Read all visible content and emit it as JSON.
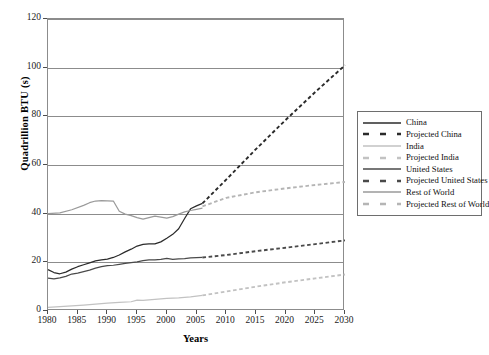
{
  "axes": {
    "ylabel": "Quadrillion BTU (s)",
    "xlabel": "Years",
    "yticks": [
      "0",
      "20",
      "40",
      "60",
      "80",
      "100",
      "120"
    ],
    "xticks": [
      "1980",
      "1985",
      "1990",
      "1995",
      "2000",
      "2005",
      "2010",
      "2015",
      "2020",
      "2025",
      "2030"
    ]
  },
  "legend": {
    "items": [
      {
        "label": "China",
        "style": "solid",
        "color": "#2b2b2b"
      },
      {
        "label": "Projected China",
        "style": "dashed",
        "color": "#2b2b2b"
      },
      {
        "label": "India",
        "style": "solid",
        "color": "#c2c2c2"
      },
      {
        "label": "Projected India",
        "style": "dashed",
        "color": "#c2c2c2"
      },
      {
        "label": "United States",
        "style": "solid",
        "color": "#4a4a4a"
      },
      {
        "label": "Projected United States",
        "style": "dashed",
        "color": "#4a4a4a"
      },
      {
        "label": "Rest of World",
        "style": "solid",
        "color": "#9a9a9a"
      },
      {
        "label": "Projected Rest of World",
        "style": "dashed",
        "color": "#b5b5b5"
      }
    ]
  },
  "chart_data": {
    "type": "line",
    "title": "",
    "xlabel": "Years",
    "ylabel": "Quadrillion BTU (s)",
    "xlim": [
      1980,
      2030
    ],
    "ylim": [
      0,
      120
    ],
    "grid": true,
    "legend_position": "right",
    "series": [
      {
        "name": "China",
        "color": "#2b2b2b",
        "style": "solid",
        "x": [
          1980,
          1981,
          1982,
          1983,
          1984,
          1985,
          1986,
          1987,
          1988,
          1989,
          1990,
          1991,
          1992,
          1993,
          1994,
          1995,
          1996,
          1997,
          1998,
          1999,
          2000,
          2001,
          2002,
          2003,
          2004,
          2005,
          2006
        ],
        "y": [
          17.0,
          15.8,
          15.3,
          16.0,
          17.2,
          18.2,
          19.0,
          19.8,
          20.6,
          21.0,
          21.3,
          22.0,
          23.0,
          24.3,
          25.4,
          26.7,
          27.4,
          27.6,
          27.6,
          28.4,
          29.9,
          31.5,
          33.8,
          38.0,
          42.0,
          43.2,
          44.2
        ]
      },
      {
        "name": "Projected China",
        "color": "#2b2b2b",
        "style": "dashed",
        "x": [
          2006,
          2010,
          2015,
          2020,
          2025,
          2030
        ],
        "y": [
          44.2,
          54.0,
          66.5,
          78.5,
          90.0,
          101.0
        ]
      },
      {
        "name": "India",
        "color": "#c2c2c2",
        "style": "solid",
        "x": [
          1980,
          1982,
          1984,
          1986,
          1988,
          1990,
          1992,
          1994,
          1995,
          1996,
          1998,
          2000,
          2002,
          2004,
          2005,
          2006
        ],
        "y": [
          1.5,
          1.8,
          2.1,
          2.4,
          2.8,
          3.2,
          3.5,
          3.8,
          4.5,
          4.4,
          4.8,
          5.2,
          5.4,
          5.8,
          6.1,
          6.4
        ]
      },
      {
        "name": "Projected India",
        "color": "#c2c2c2",
        "style": "dashed",
        "x": [
          2006,
          2010,
          2015,
          2020,
          2025,
          2030
        ],
        "y": [
          6.4,
          8.0,
          10.0,
          11.8,
          13.4,
          15.0
        ]
      },
      {
        "name": "United States",
        "color": "#4a4a4a",
        "style": "solid",
        "x": [
          1980,
          1981,
          1982,
          1983,
          1984,
          1985,
          1986,
          1987,
          1988,
          1989,
          1990,
          1991,
          1992,
          1993,
          1994,
          1995,
          1996,
          1997,
          1998,
          1999,
          2000,
          2001,
          2002,
          2003,
          2004,
          2005,
          2006
        ],
        "y": [
          13.5,
          13.2,
          13.6,
          14.2,
          15.2,
          15.6,
          16.2,
          16.8,
          17.6,
          18.2,
          18.6,
          18.8,
          19.2,
          19.6,
          19.9,
          20.2,
          20.7,
          21.0,
          21.0,
          21.2,
          21.6,
          21.2,
          21.4,
          21.5,
          21.8,
          21.9,
          22.0
        ]
      },
      {
        "name": "Projected United States",
        "color": "#4a4a4a",
        "style": "dashed",
        "x": [
          2006,
          2010,
          2015,
          2020,
          2025,
          2030
        ],
        "y": [
          22.0,
          23.0,
          24.6,
          26.0,
          27.5,
          29.0
        ]
      },
      {
        "name": "Rest of World",
        "color": "#9a9a9a",
        "style": "solid",
        "x": [
          1980,
          1982,
          1984,
          1986,
          1987,
          1988,
          1989,
          1990,
          1991,
          1992,
          1993,
          1994,
          1995,
          1996,
          1997,
          1998,
          1999,
          2000,
          2001,
          2002,
          2003,
          2004,
          2005,
          2006
        ],
        "y": [
          40.0,
          40.3,
          41.6,
          43.4,
          44.5,
          45.2,
          45.4,
          45.3,
          45.2,
          41.0,
          39.8,
          39.2,
          38.4,
          37.8,
          38.4,
          39.0,
          38.6,
          38.2,
          38.8,
          39.8,
          40.7,
          41.3,
          41.8,
          42.3
        ]
      },
      {
        "name": "Projected Rest of World",
        "color": "#b5b5b5",
        "style": "dashed",
        "x": [
          2006,
          2010,
          2015,
          2020,
          2025,
          2030
        ],
        "y": [
          43.0,
          46.5,
          48.8,
          50.4,
          51.8,
          53.0
        ]
      }
    ]
  }
}
